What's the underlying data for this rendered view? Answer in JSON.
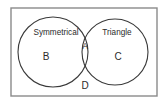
{
  "diagram": {
    "type": "venn-two-set",
    "universe": {
      "name": "universal-set-rectangle",
      "x": 11,
      "y": 8,
      "width": 146,
      "height": 88,
      "stroke_color": "#8a8a8a"
    },
    "background_color": "#ffffff",
    "sets": [
      {
        "key": "left",
        "title": "Symmetrical",
        "title_x": 56,
        "title_y": 33,
        "cx": 53,
        "cy": 52,
        "r": 35,
        "stroke_color": "#3a3a3a"
      },
      {
        "key": "right",
        "title": "Triangle",
        "title_x": 117,
        "title_y": 33,
        "cx": 115,
        "cy": 52,
        "r": 33,
        "stroke_color": "#3a3a3a"
      }
    ],
    "regions": [
      {
        "key": "intersection",
        "label": "A",
        "x": 85,
        "y": 47,
        "size": "small",
        "description": "intersection of both circles"
      },
      {
        "key": "left_only",
        "label": "B",
        "x": 46,
        "y": 57,
        "size": "normal",
        "description": "left circle only"
      },
      {
        "key": "right_only",
        "label": "C",
        "x": 118,
        "y": 57,
        "size": "normal",
        "description": "right circle only"
      },
      {
        "key": "outside",
        "label": "D",
        "x": 85,
        "y": 86,
        "size": "normal",
        "description": "inside rectangle, outside both circles"
      }
    ]
  }
}
